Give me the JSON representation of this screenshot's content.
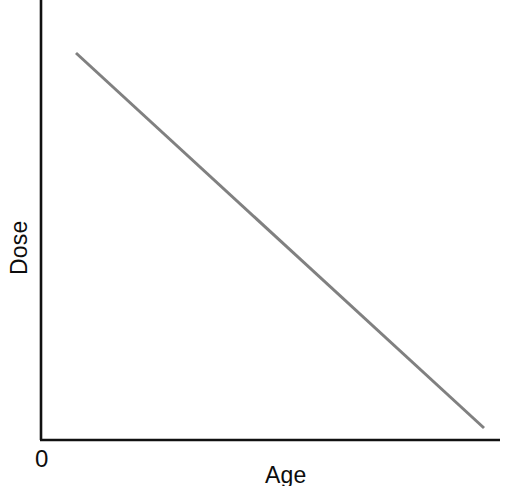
{
  "chart_data": {
    "type": "line",
    "title": "",
    "subtitle": "",
    "xlabel": "Age",
    "ylabel": "Dose",
    "origin_label": "0",
    "grid": false,
    "legend": null,
    "axis_ticks": {
      "x": [],
      "y": []
    },
    "xlim": [
      0,
      1
    ],
    "ylim": [
      0,
      1
    ],
    "annotations": [],
    "series": [
      {
        "name": "Dose vs Age",
        "color": "#808080",
        "line_width": 3,
        "x": [
          0.08,
          1.0
        ],
        "y": [
          0.88,
          0.03
        ],
        "points_px": [
          {
            "x": 76,
            "y": 53
          },
          {
            "x": 484,
            "y": 428
          }
        ],
        "description": "Single straight descending line: dose decreases linearly as age increases"
      }
    ]
  },
  "figure": {
    "background_color": "#ffffff",
    "axis_color": "#111111",
    "line_color": "#808080",
    "text_color": "#0d0d0d",
    "y_axis": {
      "x": 41,
      "y_top": 0,
      "y_bottom": 440
    },
    "x_axis": {
      "y": 440,
      "x_left": 41,
      "x_right": 500
    }
  },
  "labels": {
    "y_axis_title": "Dose",
    "x_axis_title": "Age",
    "origin": "0"
  }
}
